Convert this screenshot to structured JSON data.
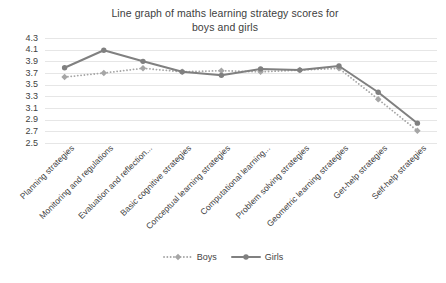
{
  "chart_data": {
    "type": "line",
    "title": "Line graph of maths learning strategy scores for boys and girls",
    "title_line1": "Line graph of maths learning strategy scores for",
    "title_line2": "boys and girls",
    "xlabel": "",
    "ylabel": "",
    "ylim": [
      2.5,
      4.3
    ],
    "grid": true,
    "legend_position": "bottom",
    "yticks": [
      "4.3",
      "4.1",
      "3.9",
      "3.7",
      "3.5",
      "3.3",
      "3.1",
      "2.9",
      "2.7",
      "2.5"
    ],
    "ytick_values": [
      4.3,
      4.1,
      3.9,
      3.7,
      3.5,
      3.3,
      3.1,
      2.9,
      2.7,
      2.5
    ],
    "categories": [
      "Planning strategies",
      "Monitoring and regulations",
      "Evaluation and reflection...",
      "Basic cognitive strategies",
      "Conceptual learning strategies",
      "Computational learning...",
      "Problem solving strategies",
      "Geometric learning strategies",
      "Get-help strategies",
      "Self-help strategies"
    ],
    "series": [
      {
        "name": "Boys",
        "color": "#a6a6a6",
        "style": "dotted",
        "marker": "diamond",
        "values": [
          3.63,
          3.7,
          3.78,
          3.72,
          3.74,
          3.72,
          3.75,
          3.78,
          3.25,
          2.71
        ]
      },
      {
        "name": "Girls",
        "color": "#808080",
        "style": "solid",
        "marker": "circle",
        "values": [
          3.79,
          4.09,
          3.9,
          3.72,
          3.66,
          3.77,
          3.75,
          3.82,
          3.37,
          2.84
        ]
      }
    ]
  },
  "legend": {
    "items": [
      {
        "label": "Boys"
      },
      {
        "label": "Girls"
      }
    ]
  }
}
